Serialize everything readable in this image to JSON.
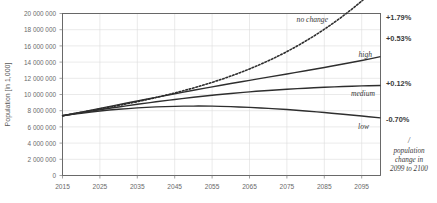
{
  "chart_data": {
    "type": "line",
    "title": "",
    "xlabel": "",
    "ylabel": "Population [in 1,000]",
    "xlim": [
      2015,
      2100
    ],
    "ylim": [
      0,
      20000000
    ],
    "grid": true,
    "legend_position": "inline-right",
    "x_ticks": [
      "2015",
      "2025",
      "2035",
      "2045",
      "2055",
      "2065",
      "2075",
      "2085",
      "2095"
    ],
    "x_tick_values": [
      2015,
      2025,
      2035,
      2045,
      2055,
      2065,
      2075,
      2085,
      2095
    ],
    "y_ticks": [
      "0",
      "2 000 000",
      "4 000 000",
      "6 000 000",
      "8 000 000",
      "10 000 000",
      "12 000 000",
      "14 000 000",
      "16 000 000",
      "18 000 000",
      "20 000 000"
    ],
    "y_tick_values": [
      0,
      2000000,
      4000000,
      6000000,
      8000000,
      10000000,
      12000000,
      14000000,
      16000000,
      18000000,
      20000000
    ],
    "x": [
      2015,
      2020,
      2025,
      2030,
      2035,
      2040,
      2045,
      2050,
      2055,
      2060,
      2065,
      2070,
      2075,
      2080,
      2085,
      2090,
      2095,
      2100
    ],
    "series": [
      {
        "name": "no change",
        "label": "no change",
        "style": "dotted",
        "color": "#2e2e2e",
        "end_rate_label": "+1.79%",
        "values": [
          7383000,
          7795000,
          8210000,
          8650000,
          9120000,
          9630000,
          10190000,
          10810000,
          11500000,
          12280000,
          13160000,
          14160000,
          15300000,
          16600000,
          18060000,
          19700000,
          21550000,
          23600000
        ]
      },
      {
        "name": "high",
        "label": "high",
        "style": "solid",
        "color": "#2e2e2e",
        "end_rate_label": "+0.53%",
        "values": [
          7383000,
          7830000,
          8290000,
          8750000,
          9200000,
          9650000,
          10090000,
          10520000,
          10940000,
          11350000,
          11750000,
          12140000,
          12530000,
          12930000,
          13340000,
          13760000,
          14200000,
          14670000
        ]
      },
      {
        "name": "medium",
        "label": "medium",
        "style": "solid",
        "color": "#2e2e2e",
        "end_rate_label": "+0.12%",
        "values": [
          7383000,
          7760000,
          8120000,
          8460000,
          8790000,
          9100000,
          9390000,
          9660000,
          9910000,
          10130000,
          10330000,
          10500000,
          10650000,
          10780000,
          10890000,
          10980000,
          11060000,
          11120000
        ]
      },
      {
        "name": "low",
        "label": "low",
        "style": "solid",
        "color": "#2e2e2e",
        "end_rate_label": "-0.70%",
        "values": [
          7383000,
          7690000,
          7960000,
          8180000,
          8350000,
          8470000,
          8540000,
          8570000,
          8560000,
          8500000,
          8410000,
          8290000,
          8140000,
          7960000,
          7770000,
          7560000,
          7340000,
          7110000
        ]
      }
    ],
    "annotations": {
      "rate_note_line1": "/",
      "rate_note_line2": "population",
      "rate_note_line3": "change in",
      "rate_note_line4": "2099 to 2100"
    }
  },
  "colors": {
    "line": "#2e2e2e",
    "grid": "#dcdcdc",
    "axis": "#5a5a5a",
    "text": "#3a3a3a",
    "background": "#ffffff"
  }
}
